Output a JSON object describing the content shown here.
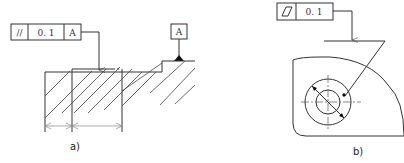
{
  "figure_a": {
    "caption": "a)",
    "tolerance_frame": {
      "symbol": "//",
      "symbol_name": "parallelism",
      "value": "0. 1",
      "datum": "A"
    },
    "datum_label": "A"
  },
  "figure_b": {
    "caption": "b)",
    "tolerance_frame": {
      "symbol": "▱",
      "symbol_name": "flatness",
      "value": "0. 1"
    }
  }
}
